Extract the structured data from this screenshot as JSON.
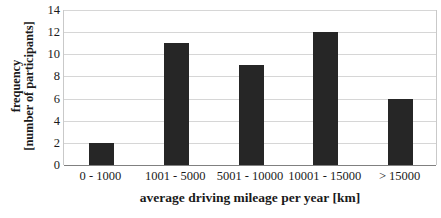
{
  "chart_data": {
    "type": "bar",
    "title": "",
    "xlabel": "average driving mileage per year [km]",
    "ylabel_line1": "frequency",
    "ylabel_line2": "[number of participants]",
    "ylabel": "frequency [number of participants]",
    "categories": [
      "0 - 1000",
      "1001 - 5000",
      "5001 - 10000",
      "10001 - 15000",
      "> 15000"
    ],
    "values": [
      2,
      11,
      9,
      12,
      6
    ],
    "ylim": [
      0,
      14
    ],
    "ytick_step": 2,
    "yticks": [
      "14",
      "12",
      "10",
      "8",
      "6",
      "4",
      "2",
      "0"
    ],
    "ytick_values": [
      14,
      12,
      10,
      8,
      6,
      4,
      2,
      0
    ],
    "grid": true,
    "grid_axis": "y",
    "legend": "none",
    "bar_color": "#262626",
    "gridline_color": "#d6d6d6",
    "axis_color": "#808080",
    "background_color": "#ffffff"
  }
}
